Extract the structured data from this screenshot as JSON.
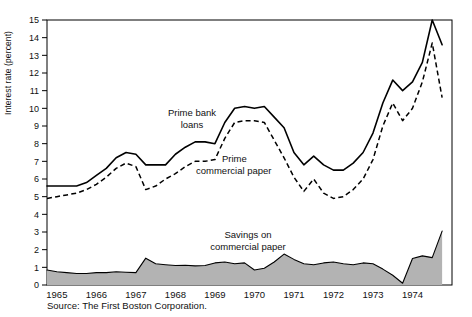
{
  "figure": {
    "source_note": "Source: The First Boston Corporation.",
    "y_axis_title": "Interest rate (percent)"
  },
  "labels": {
    "prime_bank_loans_line1": "Prime bank",
    "prime_bank_loans_line2": "loans",
    "prime_commercial_paper_line1": "Prime",
    "prime_commercial_paper_line2": "commercial paper",
    "savings_line1": "Savings on",
    "savings_line2": "commercial paper"
  },
  "colors": {
    "line": "#000000",
    "area_fill": "#b3b3b3",
    "frame": "#000000",
    "background": "#ffffff"
  },
  "chart_data": {
    "type": "line",
    "title": "",
    "subtitle": "",
    "xlabel": "",
    "ylabel": "Interest rate (percent)",
    "ylim": [
      0,
      15
    ],
    "xlim": [
      1964.75,
      1975.0
    ],
    "ytick_labels": [
      "0",
      "1",
      "2",
      "3",
      "4",
      "5",
      "6",
      "7",
      "8",
      "9",
      "10",
      "11",
      "12",
      "13",
      "14",
      "15"
    ],
    "ytick_values": [
      0,
      1,
      2,
      3,
      4,
      5,
      6,
      7,
      8,
      9,
      10,
      11,
      12,
      13,
      14,
      15
    ],
    "xtick_labels": [
      "1965",
      "1966",
      "1967",
      "1968",
      "1969",
      "1970",
      "1971",
      "1972",
      "1973",
      "1974"
    ],
    "xtick_values": [
      1965,
      1966,
      1967,
      1968,
      1969,
      1970,
      1971,
      1972,
      1973,
      1974
    ],
    "x_minor_ticks": [
      1965.5,
      1966.5,
      1967.5,
      1968.5,
      1969.5,
      1970.5,
      1971.5,
      1972.5,
      1973.5,
      1974.5
    ],
    "grid": false,
    "legend": "inline annotations",
    "x": [
      1964.75,
      1965.0,
      1965.25,
      1965.5,
      1965.75,
      1966.0,
      1966.25,
      1966.5,
      1966.75,
      1967.0,
      1967.25,
      1967.5,
      1967.75,
      1968.0,
      1968.25,
      1968.5,
      1968.75,
      1969.0,
      1969.25,
      1969.5,
      1969.75,
      1970.0,
      1970.25,
      1970.5,
      1970.75,
      1971.0,
      1971.25,
      1971.5,
      1971.75,
      1972.0,
      1972.25,
      1972.5,
      1972.75,
      1973.0,
      1973.25,
      1973.5,
      1973.75,
      1974.0,
      1974.25,
      1974.5,
      1974.75
    ],
    "series": [
      {
        "name": "Prime bank loans",
        "style": "solid",
        "values": [
          5.6,
          5.6,
          5.6,
          5.6,
          5.8,
          6.2,
          6.6,
          7.2,
          7.5,
          7.4,
          6.8,
          6.8,
          6.8,
          7.4,
          7.8,
          8.1,
          8.1,
          8.0,
          9.2,
          10.0,
          10.1,
          10.0,
          10.1,
          9.5,
          8.9,
          7.5,
          6.8,
          7.3,
          6.8,
          6.5,
          6.5,
          6.9,
          7.5,
          8.6,
          10.3,
          11.6,
          11.0,
          11.5,
          12.6,
          15.0,
          13.6
        ]
      },
      {
        "name": "Prime commercial paper",
        "style": "dashed",
        "values": [
          4.9,
          5.0,
          5.1,
          5.2,
          5.4,
          5.7,
          6.1,
          6.6,
          6.9,
          6.7,
          5.4,
          5.6,
          6.0,
          6.3,
          6.7,
          7.0,
          7.0,
          7.1,
          8.3,
          9.2,
          9.3,
          9.3,
          9.2,
          8.2,
          7.2,
          6.1,
          5.3,
          6.0,
          5.2,
          4.9,
          5.0,
          5.4,
          6.0,
          7.1,
          9.0,
          10.3,
          9.3,
          10.0,
          11.5,
          13.7,
          10.6
        ]
      },
      {
        "name": "Savings on commercial paper",
        "style": "filled-area",
        "values": [
          0.85,
          0.75,
          0.7,
          0.65,
          0.65,
          0.7,
          0.7,
          0.75,
          0.72,
          0.7,
          1.52,
          1.2,
          1.15,
          1.1,
          1.12,
          1.08,
          1.1,
          1.25,
          1.3,
          1.2,
          1.25,
          0.85,
          0.95,
          1.3,
          1.75,
          1.45,
          1.2,
          1.15,
          1.25,
          1.3,
          1.2,
          1.15,
          1.25,
          1.2,
          0.9,
          0.55,
          0.1,
          1.5,
          1.65,
          1.55,
          3.05
        ]
      }
    ]
  }
}
